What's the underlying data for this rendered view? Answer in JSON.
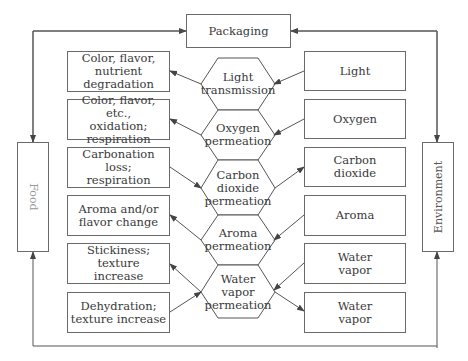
{
  "packaging": {
    "label": "Packaging"
  },
  "food": {
    "label": "Food"
  },
  "environment": {
    "label": "Environment"
  },
  "hexagons": [
    {
      "label": "Light transmission"
    },
    {
      "label": "Oxygen permeation"
    },
    {
      "label": "Carbon dioxide permeation"
    },
    {
      "label": "Aroma permeation"
    },
    {
      "label": "Water vapor permeation"
    }
  ],
  "hex_lines": {
    "0": [
      "Light",
      "transmission"
    ],
    "1": [
      "Oxygen",
      "permeation"
    ],
    "2": [
      "Carbon",
      "dioxide",
      "permeation"
    ],
    "3": [
      "Aroma",
      "permeation"
    ],
    "4": [
      "Water",
      "vapor",
      "permeation"
    ]
  },
  "food_effects": [
    {
      "line1": "Color, flavor,",
      "line2": "nutrient degradation"
    },
    {
      "line1": "Color, flavor, etc.,",
      "line2": "oxidation; respiration"
    },
    {
      "line1": "Carbonation loss;",
      "line2": "respiration"
    },
    {
      "line1": "Aroma and/or",
      "line2": "flavor change"
    },
    {
      "line1": "Stickiness; texture",
      "line2": "increase"
    },
    {
      "line1": "Dehydration;",
      "line2": "texture increase"
    }
  ],
  "environment_factors": [
    {
      "line1": "Light",
      "line2": ""
    },
    {
      "line1": "Oxygen",
      "line2": ""
    },
    {
      "line1": "Carbon",
      "line2": "dioxide"
    },
    {
      "line1": "Aroma",
      "line2": ""
    },
    {
      "line1": "Water",
      "line2": "vapor"
    },
    {
      "line1": "Water",
      "line2": "vapor"
    }
  ],
  "colors": {
    "line": "#555555",
    "border": "#6a6a6a",
    "text": "#3a3a3a"
  }
}
